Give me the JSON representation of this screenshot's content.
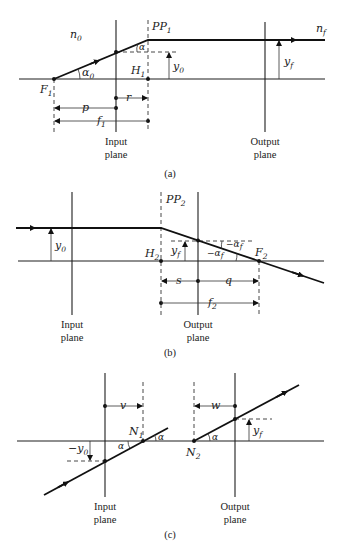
{
  "panels": [
    {
      "id": "a",
      "caption": "(a)",
      "labels": {
        "medium_in": "n",
        "medium_in_sub": "0",
        "medium_out": "n",
        "medium_out_sub": "f",
        "principal_plane": "PP",
        "principal_plane_sub": "1",
        "focal_point": "F",
        "focal_point_sub": "1",
        "principal_point": "H",
        "principal_point_sub": "1",
        "angle_in": "α",
        "angle_in_sub": "0",
        "angle": "α",
        "height_in": "y",
        "height_in_sub": "0",
        "height_out": "y",
        "height_out_sub": "f",
        "dist_p": "p",
        "dist_r": "r",
        "dist_f": "f",
        "dist_f_sub": "1",
        "input_plane_line1": "Input",
        "input_plane_line2": "plane",
        "output_plane_line1": "Output",
        "output_plane_line2": "plane"
      }
    },
    {
      "id": "b",
      "caption": "(b)",
      "labels": {
        "principal_plane": "PP",
        "principal_plane_sub": "2",
        "focal_point": "F",
        "focal_point_sub": "2",
        "principal_point": "H",
        "principal_point_sub": "2",
        "height_in": "y",
        "height_in_sub": "0",
        "height_out": "y",
        "height_out_sub": "f",
        "angle_out": "−α",
        "angle_out_sub": "f",
        "dist_s": "s",
        "dist_q": "q",
        "dist_f": "f",
        "dist_f_sub": "2",
        "input_plane_line1": "Input",
        "input_plane_line2": "plane",
        "output_plane_line1": "Output",
        "output_plane_line2": "plane"
      }
    },
    {
      "id": "c",
      "caption": "(c)",
      "labels": {
        "nodal_1": "N",
        "nodal_1_sub": "1",
        "nodal_2": "N",
        "nodal_2_sub": "2",
        "angle": "α",
        "height_in": "−y",
        "height_in_sub": "0",
        "height_out": "y",
        "height_out_sub": "f",
        "dist_v": "v",
        "dist_w": "w",
        "input_plane_line1": "Input",
        "input_plane_line2": "plane",
        "output_plane_line1": "Output",
        "output_plane_line2": "plane"
      }
    }
  ]
}
